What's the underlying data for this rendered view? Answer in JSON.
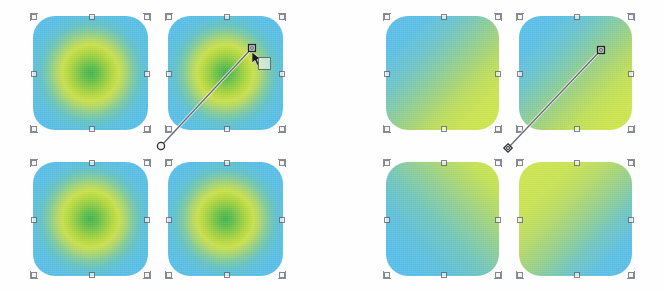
{
  "app": {
    "title": "Gradient swatches canvas",
    "background": "#ffffff"
  },
  "palette": {
    "blue": "#56bbe6",
    "green_light": "#cbe34c",
    "green_mid": "#8ec93f",
    "green_core": "#3fae4b",
    "handle_stroke": "#5d5f68",
    "handle_fill": "#f2f2f2",
    "gradient_line": "#6b6d75"
  },
  "groups": [
    {
      "id": "left-group",
      "name": "radial-gradient-group",
      "gradient_type": "radial",
      "tiles": [
        {
          "id": "tile-r1",
          "name": "swatch-radial-top-left",
          "x": 33,
          "y": 16,
          "w": 115,
          "h": 114,
          "style": "rad"
        },
        {
          "id": "tile-r2",
          "name": "swatch-radial-top-right",
          "x": 168,
          "y": 16,
          "w": 115,
          "h": 114,
          "style": "rad"
        },
        {
          "id": "tile-r3",
          "name": "swatch-radial-bottom-left",
          "x": 33,
          "y": 162,
          "w": 115,
          "h": 114,
          "style": "rad"
        },
        {
          "id": "tile-r4",
          "name": "swatch-radial-bottom-right",
          "x": 168,
          "y": 162,
          "w": 115,
          "h": 114,
          "style": "rad"
        }
      ],
      "gradient_handles": {
        "start": {
          "shape": "circle",
          "x": 161,
          "y": 146
        },
        "end": {
          "shape": "square",
          "x": 252,
          "y": 48
        },
        "stops": []
      }
    },
    {
      "id": "right-group",
      "name": "linear-gradient-group",
      "gradient_type": "linear",
      "tiles": [
        {
          "id": "tile-l1",
          "name": "swatch-linear-top-left",
          "x": 386,
          "y": 16,
          "w": 113,
          "h": 114,
          "style": "lin-br"
        },
        {
          "id": "tile-l2",
          "name": "swatch-linear-top-right",
          "x": 519,
          "y": 16,
          "w": 113,
          "h": 114,
          "style": "lin-br"
        },
        {
          "id": "tile-l3",
          "name": "swatch-linear-bottom-left",
          "x": 386,
          "y": 162,
          "w": 113,
          "h": 114,
          "style": "lin-tr"
        },
        {
          "id": "tile-l4",
          "name": "swatch-linear-bottom-right",
          "x": 519,
          "y": 162,
          "w": 113,
          "h": 114,
          "style": "lin-tl"
        }
      ],
      "gradient_handles": {
        "start": {
          "shape": "diamond",
          "x": 508,
          "y": 148
        },
        "end": {
          "shape": "square",
          "x": 601,
          "y": 50
        },
        "stops": []
      }
    }
  ],
  "cursor": {
    "name": "move-cursor",
    "x": 252,
    "y": 52
  },
  "badge": {
    "name": "gradient-stop-badge",
    "label": "",
    "x": 258,
    "y": 57
  }
}
